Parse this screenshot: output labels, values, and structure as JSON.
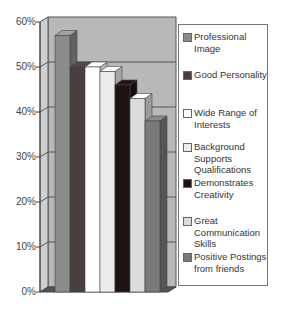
{
  "chart_data": {
    "type": "bar",
    "title": "",
    "xlabel": "",
    "ylabel": "",
    "ylim": [
      0,
      60
    ],
    "yticks": [
      "0%",
      "10%",
      "20%",
      "30%",
      "40%",
      "50%",
      "60%"
    ],
    "grid": true,
    "legend_position": "right",
    "three_d": true,
    "categories": [
      ""
    ],
    "series": [
      {
        "name": "Professional Image",
        "values": [
          57
        ],
        "color": "#8c8c8c"
      },
      {
        "name": "Good Personality",
        "values": [
          50
        ],
        "color": "#4a3e3e"
      },
      {
        "name": "Wide Range of Interests",
        "values": [
          50
        ],
        "color": "#ffffff"
      },
      {
        "name": "Background Supports Qualifications",
        "values": [
          49
        ],
        "color": "#ececec"
      },
      {
        "name": "Demonstrates Creativity",
        "values": [
          46
        ],
        "color": "#1e1212"
      },
      {
        "name": "Great Communication Skills",
        "values": [
          43
        ],
        "color": "#dcdcdc"
      },
      {
        "name": "Positive Postings from friends",
        "values": [
          38
        ],
        "color": "#7a7a7a"
      }
    ]
  },
  "legend": {
    "items": [
      {
        "label": "Professional Image"
      },
      {
        "label": "Good Personality"
      },
      {
        "label": "Wide Range of Interests"
      },
      {
        "label": "Background Supports Qualifications"
      },
      {
        "label": "Demonstrates Creativity"
      },
      {
        "label": "Great Communication Skills"
      },
      {
        "label": "Positive Postings from friends"
      }
    ]
  },
  "axis": {
    "ticks": [
      "0%",
      "10%",
      "20%",
      "30%",
      "40%",
      "50%",
      "60%"
    ]
  }
}
